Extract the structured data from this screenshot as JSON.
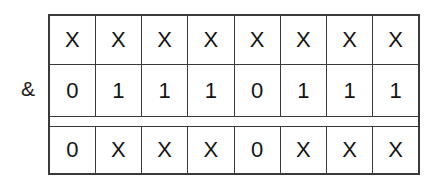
{
  "figure": {
    "kind": "bitwise-and-diagram",
    "operator": "&",
    "background_color": "#ffffff",
    "line_color": "#3a3a3a",
    "rule_color": "#000000",
    "text_color": "#141414"
  },
  "table": {
    "columns": 8,
    "rows": [
      {
        "name": "mask-row",
        "cells": [
          "X",
          "X",
          "X",
          "X",
          "X",
          "X",
          "X",
          "X"
        ]
      },
      {
        "name": "operand-row",
        "cells": [
          "0",
          "1",
          "1",
          "1",
          "0",
          "1",
          "1",
          "1"
        ]
      },
      {
        "name": "result-row",
        "cells": [
          "0",
          "X",
          "X",
          "X",
          "0",
          "X",
          "X",
          "X"
        ]
      }
    ]
  },
  "chart_data": {
    "type": "table",
    "title": "",
    "categories": [
      "bit7",
      "bit6",
      "bit5",
      "bit4",
      "bit3",
      "bit2",
      "bit1",
      "bit0"
    ],
    "series": [
      {
        "name": "mask-row",
        "values": [
          "X",
          "X",
          "X",
          "X",
          "X",
          "X",
          "X",
          "X"
        ]
      },
      {
        "name": "operand-row",
        "values": [
          "0",
          "1",
          "1",
          "1",
          "0",
          "1",
          "1",
          "1"
        ]
      },
      {
        "name": "result-row",
        "values": [
          "0",
          "X",
          "X",
          "X",
          "0",
          "X",
          "X",
          "X"
        ]
      }
    ],
    "operator": "&",
    "xlabel": "",
    "ylabel": "",
    "grid": true,
    "legend": "none"
  }
}
